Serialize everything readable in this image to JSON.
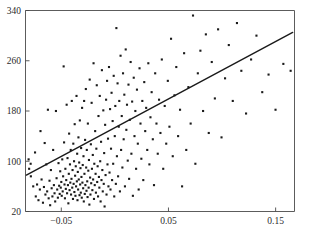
{
  "chart_data": {
    "type": "scatter",
    "title": "",
    "subtitle": "",
    "xlabel": "",
    "ylabel": "",
    "grid": false,
    "legend": null,
    "xlim": [
      -0.0834,
      0.1676
    ],
    "ylim": [
      20,
      340
    ],
    "xticks": [
      -0.05,
      0.05,
      0.15
    ],
    "xtick_labels": [
      "−0.05",
      "0.05",
      "0.15"
    ],
    "yticks": [
      20,
      100,
      180,
      260,
      340
    ],
    "ytick_labels": [
      "20",
      "100",
      "180",
      "260",
      "340"
    ],
    "marker": "filled-square",
    "marker_color": "#1a1a1a",
    "marker_size_px": 2.1,
    "fit_line": {
      "type": "linear",
      "color": "#1a1a1a",
      "width_px": 1.4,
      "x_start": -0.0826,
      "y_start": 78,
      "x_end": 0.1659,
      "y_end": 305,
      "slope": 913.5,
      "intercept": 153.5
    },
    "n_points": 232,
    "points": [
      [
        -0.0805,
        103
      ],
      [
        -0.08,
        88
      ],
      [
        -0.0786,
        96
      ],
      [
        -0.0784,
        76
      ],
      [
        -0.0762,
        60
      ],
      [
        -0.0745,
        114
      ],
      [
        -0.0738,
        44
      ],
      [
        -0.0726,
        63
      ],
      [
        -0.0713,
        38
      ],
      [
        -0.07,
        55
      ],
      [
        -0.0694,
        148
      ],
      [
        -0.0684,
        71
      ],
      [
        -0.0671,
        34
      ],
      [
        -0.0662,
        59
      ],
      [
        -0.0655,
        129
      ],
      [
        -0.0648,
        47
      ],
      [
        -0.064,
        95
      ],
      [
        -0.0632,
        52
      ],
      [
        -0.0625,
        182
      ],
      [
        -0.0618,
        41
      ],
      [
        -0.061,
        69
      ],
      [
        -0.0604,
        30
      ],
      [
        -0.0597,
        86
      ],
      [
        -0.059,
        57
      ],
      [
        -0.0583,
        44
      ],
      [
        -0.0576,
        118
      ],
      [
        -0.0569,
        62
      ],
      [
        -0.0563,
        49
      ],
      [
        -0.0557,
        36
      ],
      [
        -0.055,
        180
      ],
      [
        -0.0544,
        73
      ],
      [
        -0.0538,
        55
      ],
      [
        -0.0532,
        42
      ],
      [
        -0.0526,
        97
      ],
      [
        -0.052,
        61
      ],
      [
        -0.0515,
        48
      ],
      [
        -0.051,
        84
      ],
      [
        -0.0505,
        58
      ],
      [
        -0.05,
        67
      ],
      [
        -0.0496,
        45
      ],
      [
        -0.0491,
        103
      ],
      [
        -0.0487,
        52
      ],
      [
        -0.0483,
        76
      ],
      [
        -0.0478,
        251
      ],
      [
        -0.0474,
        130
      ],
      [
        -0.047,
        63
      ],
      [
        -0.0466,
        41
      ],
      [
        -0.0462,
        88
      ],
      [
        -0.0458,
        56
      ],
      [
        -0.0454,
        70
      ],
      [
        -0.045,
        190
      ],
      [
        -0.0446,
        49
      ],
      [
        -0.0442,
        105
      ],
      [
        -0.0438,
        62
      ],
      [
        -0.0434,
        33
      ],
      [
        -0.043,
        80
      ],
      [
        -0.0427,
        144
      ],
      [
        -0.0423,
        54
      ],
      [
        -0.0419,
        95
      ],
      [
        -0.0416,
        66
      ],
      [
        -0.0412,
        118
      ],
      [
        -0.0409,
        47
      ],
      [
        -0.0405,
        72
      ],
      [
        -0.0402,
        196
      ],
      [
        -0.0398,
        58
      ],
      [
        -0.0395,
        86
      ],
      [
        -0.0391,
        40
      ],
      [
        -0.0388,
        128
      ],
      [
        -0.0385,
        64
      ],
      [
        -0.0381,
        100
      ],
      [
        -0.0378,
        51
      ],
      [
        -0.0375,
        159
      ],
      [
        -0.0371,
        77
      ],
      [
        -0.0368,
        45
      ],
      [
        -0.0365,
        92
      ],
      [
        -0.0362,
        60
      ],
      [
        -0.0358,
        204
      ],
      [
        -0.0355,
        68
      ],
      [
        -0.0352,
        112
      ],
      [
        -0.0349,
        38
      ],
      [
        -0.0346,
        83
      ],
      [
        -0.0343,
        55
      ],
      [
        -0.034,
        138
      ],
      [
        -0.0337,
        71
      ],
      [
        -0.0333,
        98
      ],
      [
        -0.033,
        46
      ],
      [
        -0.0327,
        165
      ],
      [
        -0.0324,
        63
      ],
      [
        -0.0321,
        89
      ],
      [
        -0.0318,
        50
      ],
      [
        -0.0315,
        121
      ],
      [
        -0.0312,
        75
      ],
      [
        -0.0309,
        42
      ],
      [
        -0.0306,
        185
      ],
      [
        -0.0303,
        66
      ],
      [
        -0.03,
        94
      ],
      [
        -0.0296,
        57
      ],
      [
        -0.0293,
        108
      ],
      [
        -0.029,
        36
      ],
      [
        -0.0287,
        196
      ],
      [
        -0.0284,
        80
      ],
      [
        -0.0281,
        48
      ],
      [
        -0.0278,
        134
      ],
      [
        -0.0275,
        62
      ],
      [
        -0.0271,
        215
      ],
      [
        -0.0268,
        90
      ],
      [
        -0.0265,
        53
      ],
      [
        -0.0262,
        118
      ],
      [
        -0.0258,
        68
      ],
      [
        -0.0255,
        43
      ],
      [
        -0.0252,
        160
      ],
      [
        -0.0248,
        85
      ],
      [
        -0.0245,
        58
      ],
      [
        -0.0242,
        102
      ],
      [
        -0.0238,
        31
      ],
      [
        -0.0235,
        230
      ],
      [
        -0.0231,
        74
      ],
      [
        -0.0228,
        47
      ],
      [
        -0.0224,
        127
      ],
      [
        -0.0221,
        65
      ],
      [
        -0.0217,
        193
      ],
      [
        -0.0214,
        88
      ],
      [
        -0.021,
        54
      ],
      [
        -0.0206,
        110
      ],
      [
        -0.0203,
        71
      ],
      [
        -0.0199,
        256
      ],
      [
        -0.0195,
        40
      ],
      [
        -0.0192,
        96
      ],
      [
        -0.0188,
        62
      ],
      [
        -0.0184,
        148
      ],
      [
        -0.018,
        80
      ],
      [
        -0.0177,
        50
      ],
      [
        -0.0173,
        120
      ],
      [
        -0.0169,
        221
      ],
      [
        -0.0165,
        67
      ],
      [
        -0.0161,
        92
      ],
      [
        -0.0157,
        44
      ],
      [
        -0.0153,
        172
      ],
      [
        -0.0149,
        75
      ],
      [
        -0.0145,
        58
      ],
      [
        -0.0141,
        204
      ],
      [
        -0.0137,
        100
      ],
      [
        -0.0133,
        36
      ],
      [
        -0.0129,
        131
      ],
      [
        -0.0125,
        70
      ],
      [
        -0.0121,
        245
      ],
      [
        -0.0117,
        86
      ],
      [
        -0.0113,
        52
      ],
      [
        -0.0108,
        181
      ],
      [
        -0.0104,
        64
      ],
      [
        -0.01,
        113
      ],
      [
        -0.0096,
        28
      ],
      [
        -0.0091,
        158
      ],
      [
        -0.0087,
        78
      ],
      [
        -0.0082,
        198
      ],
      [
        -0.0078,
        47
      ],
      [
        -0.0073,
        228
      ],
      [
        -0.0069,
        95
      ],
      [
        -0.0064,
        136
      ],
      [
        -0.006,
        60
      ],
      [
        -0.0055,
        250
      ],
      [
        -0.005,
        82
      ],
      [
        -0.0045,
        183
      ],
      [
        -0.0041,
        55
      ],
      [
        -0.0036,
        120
      ],
      [
        -0.0031,
        209
      ],
      [
        -0.0026,
        70
      ],
      [
        -0.0021,
        164
      ],
      [
        -0.0016,
        96
      ],
      [
        -0.0011,
        236
      ],
      [
        -0.0006,
        44
      ],
      [
        -0.0001,
        140
      ],
      [
        0.0004,
        188
      ],
      [
        0.0009,
        64
      ],
      [
        0.0014,
        312
      ],
      [
        0.0019,
        108
      ],
      [
        0.0025,
        224
      ],
      [
        0.003,
        76
      ],
      [
        0.0036,
        155
      ],
      [
        0.0041,
        196
      ],
      [
        0.0047,
        52
      ],
      [
        0.0053,
        268
      ],
      [
        0.0058,
        118
      ],
      [
        0.0064,
        172
      ],
      [
        0.007,
        90
      ],
      [
        0.0076,
        240
      ],
      [
        0.0082,
        135
      ],
      [
        0.0088,
        206
      ],
      [
        0.0094,
        60
      ],
      [
        0.0101,
        278
      ],
      [
        0.0107,
        150
      ],
      [
        0.0113,
        190
      ],
      [
        0.012,
        101
      ],
      [
        0.0127,
        222
      ],
      [
        0.0133,
        72
      ],
      [
        0.014,
        166
      ],
      [
        0.0147,
        258
      ],
      [
        0.0154,
        112
      ],
      [
        0.0161,
        195
      ],
      [
        0.0168,
        45
      ],
      [
        0.0176,
        233
      ],
      [
        0.0183,
        140
      ],
      [
        0.0191,
        180
      ],
      [
        0.0198,
        88
      ],
      [
        0.0206,
        214
      ],
      [
        0.0214,
        128
      ],
      [
        0.0222,
        55
      ],
      [
        0.023,
        248
      ],
      [
        0.0239,
        160
      ],
      [
        0.0247,
        104
      ],
      [
        0.0256,
        196
      ],
      [
        0.0265,
        70
      ],
      [
        0.0274,
        226
      ],
      [
        0.0283,
        148
      ],
      [
        0.0292,
        185
      ],
      [
        0.0302,
        118
      ],
      [
        0.0312,
        256
      ],
      [
        0.0322,
        95
      ],
      [
        0.0332,
        170
      ],
      [
        0.0343,
        210
      ],
      [
        0.0354,
        135
      ],
      [
        0.0365,
        62
      ],
      [
        0.0376,
        240
      ],
      [
        0.0388,
        160
      ],
      [
        0.04,
        112
      ],
      [
        0.0412,
        198
      ],
      [
        0.0425,
        145
      ],
      [
        0.0438,
        262
      ],
      [
        0.0451,
        88
      ],
      [
        0.0465,
        188
      ],
      [
        0.0479,
        128
      ],
      [
        0.0494,
        228
      ],
      [
        0.0509,
        155
      ],
      [
        0.0524,
        295
      ],
      [
        0.054,
        108
      ],
      [
        0.0556,
        205
      ],
      [
        0.0573,
        250
      ],
      [
        0.059,
        140
      ],
      [
        0.0608,
        182
      ],
      [
        0.0627,
        60
      ],
      [
        0.0646,
        272
      ],
      [
        0.0666,
        118
      ],
      [
        0.0686,
        218
      ],
      [
        0.0707,
        160
      ],
      [
        0.0729,
        332
      ],
      [
        0.0751,
        96
      ],
      [
        0.0774,
        240
      ],
      [
        0.0798,
        276
      ],
      [
        0.0823,
        180
      ],
      [
        0.0849,
        302
      ],
      [
        0.0876,
        145
      ],
      [
        0.0904,
        258
      ],
      [
        0.0933,
        200
      ],
      [
        0.0963,
        310
      ],
      [
        0.0995,
        138
      ],
      [
        0.1028,
        232
      ],
      [
        0.1063,
        285
      ],
      [
        0.11,
        196
      ],
      [
        0.1139,
        320
      ],
      [
        0.118,
        244
      ],
      [
        0.1224,
        176
      ],
      [
        0.1271,
        262
      ],
      [
        0.1321,
        300
      ],
      [
        0.1375,
        210
      ],
      [
        0.1434,
        238
      ],
      [
        0.1499,
        182
      ],
      [
        0.1572,
        255
      ],
      [
        0.164,
        244
      ]
    ]
  }
}
